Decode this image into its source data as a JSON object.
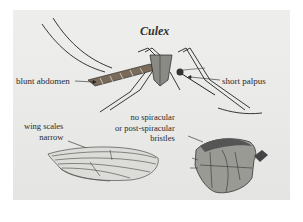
{
  "figure": {
    "title": "Culex",
    "labels": {
      "blunt_abdomen": "blunt abdomen",
      "short_palpus": "short palpus",
      "wing_scales_line1": "wing scales",
      "wing_scales_line2": "narrow",
      "spiracular_line1": "no spiracular",
      "spiracular_line2": "or post-spiracular",
      "spiracular_line3": "bristles"
    },
    "colors": {
      "panel_background": "#e9e9e7",
      "ink": "#2a2a2a",
      "body_brown": "#6b5a4a",
      "thorax_gray": "#8a8a85"
    }
  }
}
